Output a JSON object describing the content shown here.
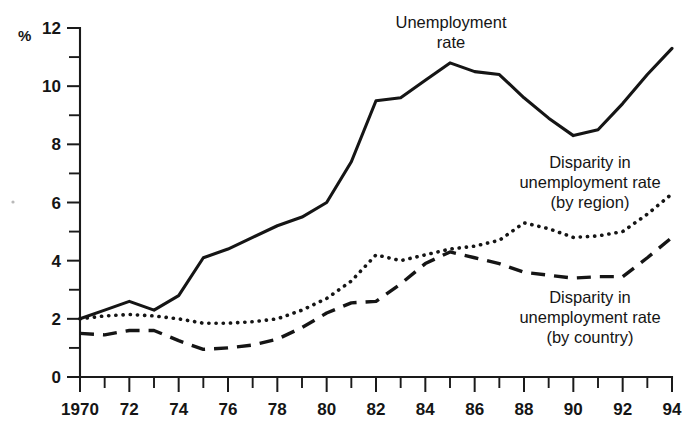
{
  "chart_data": {
    "type": "line",
    "title": "",
    "xlabel": "",
    "ylabel": "%",
    "unit_label": "%",
    "xlim": [
      1970,
      1994
    ],
    "ylim": [
      0,
      12
    ],
    "y_ticks_major": [
      0,
      2,
      4,
      6,
      8,
      10,
      12
    ],
    "y_ticks_minor": [
      1,
      3,
      5,
      7,
      9,
      11
    ],
    "y_tick_labels": [
      "0",
      "2",
      "4",
      "6",
      "8",
      "10",
      "12"
    ],
    "x": [
      1970,
      1971,
      1972,
      1973,
      1974,
      1975,
      1976,
      1977,
      1978,
      1979,
      1980,
      1981,
      1982,
      1983,
      1984,
      1985,
      1986,
      1987,
      1988,
      1989,
      1990,
      1991,
      1992,
      1993,
      1994
    ],
    "x_ticks_major": [
      1970,
      1972,
      1974,
      1976,
      1978,
      1980,
      1982,
      1984,
      1986,
      1988,
      1990,
      1992,
      1994
    ],
    "x_tick_labels": [
      "1970",
      "72",
      "74",
      "76",
      "78",
      "80",
      "82",
      "84",
      "86",
      "88",
      "90",
      "92",
      "94"
    ],
    "grid": false,
    "legend": "annotations-on-plot",
    "series": [
      {
        "name": "Unemployment rate",
        "style": "solid",
        "values": [
          2.0,
          2.3,
          2.6,
          2.3,
          2.8,
          4.1,
          4.4,
          4.8,
          5.2,
          5.5,
          6.0,
          7.4,
          9.5,
          9.6,
          10.2,
          10.8,
          10.5,
          10.4,
          9.6,
          8.9,
          8.3,
          8.5,
          9.4,
          10.4,
          11.3
        ]
      },
      {
        "name": "Disparity in unemployment rate (by region)",
        "style": "dotted",
        "values": [
          2.0,
          2.1,
          2.15,
          2.1,
          2.0,
          1.85,
          1.85,
          1.9,
          2.0,
          2.3,
          2.7,
          3.3,
          4.2,
          4.0,
          4.2,
          4.4,
          4.5,
          4.7,
          5.3,
          5.1,
          4.8,
          4.85,
          5.0,
          5.6,
          6.3
        ]
      },
      {
        "name": "Disparity in unemployment rate (by country)",
        "style": "dashed",
        "values": [
          1.5,
          1.45,
          1.6,
          1.6,
          1.25,
          0.95,
          1.0,
          1.1,
          1.3,
          1.7,
          2.2,
          2.55,
          2.6,
          3.2,
          3.9,
          4.3,
          4.1,
          3.9,
          3.6,
          3.5,
          3.4,
          3.45,
          3.45,
          4.1,
          4.8
        ]
      }
    ],
    "annotations": [
      {
        "id": "unemployment-rate-label",
        "lines": [
          "Unemployment",
          "rate"
        ],
        "x_px": 451,
        "y_px": 28
      },
      {
        "id": "disparity-region-label",
        "lines": [
          "Disparity in",
          "unemployment rate",
          "(by region)"
        ],
        "x_px": 590,
        "y_px": 168
      },
      {
        "id": "disparity-country-label",
        "lines": [
          "Disparity in",
          "unemployment rate",
          "(by country)"
        ],
        "x_px": 590,
        "y_px": 303
      }
    ],
    "colors": {
      "ink": "#151515",
      "background": "#ffffff"
    }
  }
}
